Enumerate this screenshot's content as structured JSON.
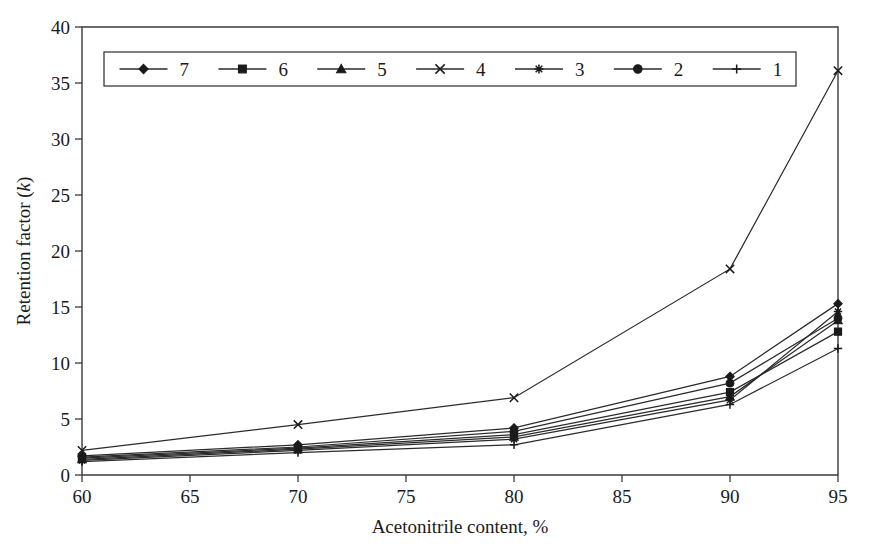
{
  "chart_data": {
    "type": "line",
    "title": "",
    "xlabel": "Acetonitrile content, %",
    "ylabel": "Retention factor (k)",
    "ylabel_italic_part": "k",
    "x": [
      60,
      70,
      80,
      90,
      95
    ],
    "xlim": [
      60,
      95
    ],
    "ylim": [
      0,
      40
    ],
    "xticks": [
      60,
      65,
      70,
      75,
      80,
      85,
      90,
      95
    ],
    "yticks": [
      0,
      5,
      10,
      15,
      20,
      25,
      30,
      35,
      40
    ],
    "grid": false,
    "legend_position": "top-left-inside",
    "series": [
      {
        "name": "7",
        "marker": "diamond",
        "values": [
          1.7,
          2.7,
          4.2,
          8.8,
          15.3
        ]
      },
      {
        "name": "6",
        "marker": "square",
        "values": [
          1.5,
          2.4,
          3.6,
          7.4,
          12.8
        ]
      },
      {
        "name": "5",
        "marker": "triangle",
        "values": [
          1.4,
          2.3,
          3.4,
          7.0,
          13.8
        ]
      },
      {
        "name": "4",
        "marker": "cross-x",
        "values": [
          2.2,
          4.5,
          6.9,
          18.4,
          36.1
        ]
      },
      {
        "name": "3",
        "marker": "asterisk",
        "values": [
          1.3,
          2.2,
          3.2,
          6.7,
          14.6
        ]
      },
      {
        "name": "2",
        "marker": "circle",
        "values": [
          1.6,
          2.5,
          3.9,
          8.2,
          14.0
        ]
      },
      {
        "name": "1",
        "marker": "plus",
        "values": [
          1.2,
          2.0,
          2.7,
          6.3,
          11.3
        ]
      }
    ]
  },
  "legend": {
    "entries": [
      {
        "label": "7",
        "marker": "diamond"
      },
      {
        "label": "6",
        "marker": "square"
      },
      {
        "label": "5",
        "marker": "triangle"
      },
      {
        "label": "4",
        "marker": "cross-x"
      },
      {
        "label": "3",
        "marker": "asterisk"
      },
      {
        "label": "2",
        "marker": "circle"
      },
      {
        "label": "1",
        "marker": "plus"
      }
    ]
  },
  "colors": {
    "line": "#2b2b2b",
    "axis": "#3a3a3a",
    "text": "#1a1a1a",
    "background": "#ffffff"
  }
}
